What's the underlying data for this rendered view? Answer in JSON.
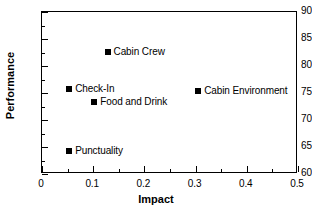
{
  "chart_data": {
    "type": "scatter",
    "title": "",
    "xlabel": "Impact",
    "ylabel": "Performance",
    "xlim": [
      0,
      0.5
    ],
    "ylim": [
      60,
      90
    ],
    "x_major_ticks": [
      "0",
      "0.1",
      "0.2",
      "0.3",
      "0.4",
      "0.5"
    ],
    "x_major_values": [
      0,
      0.1,
      0.2,
      0.3,
      0.4,
      0.5
    ],
    "x_minor_values": [
      0.05,
      0.15,
      0.25,
      0.35,
      0.45
    ],
    "y_major_ticks": [
      "60",
      "65",
      "70",
      "75",
      "80",
      "85",
      "90"
    ],
    "y_major_values": [
      60,
      65,
      70,
      75,
      80,
      85,
      90
    ],
    "y_minor_values": [
      62.5,
      67.5,
      72.5,
      77.5,
      82.5,
      87.5
    ],
    "grid": false,
    "legend": false,
    "marker_style": "filled-square",
    "marker_color": "#000000",
    "points": [
      {
        "label": "Cabin Crew",
        "x": 0.128,
        "y": 82.6
      },
      {
        "label": "Check-In",
        "x": 0.053,
        "y": 75.7
      },
      {
        "label": "Food and Drink",
        "x": 0.102,
        "y": 73.3
      },
      {
        "label": "Cabin Environment",
        "x": 0.305,
        "y": 75.4
      },
      {
        "label": "Punctuality",
        "x": 0.053,
        "y": 64.2
      }
    ]
  }
}
